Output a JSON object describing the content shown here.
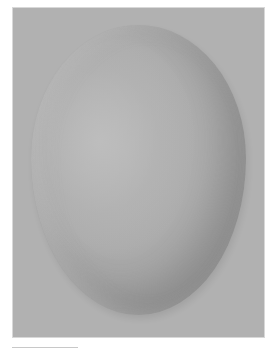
{
  "image": {
    "subject": "egg",
    "description": "Grayscale shaded egg on a gray background",
    "colors": {
      "background": "#b1b1b1",
      "egg_highlight": "#bcbcbc",
      "egg_shadow": "#8f8f8f",
      "page": "#ffffff"
    }
  }
}
